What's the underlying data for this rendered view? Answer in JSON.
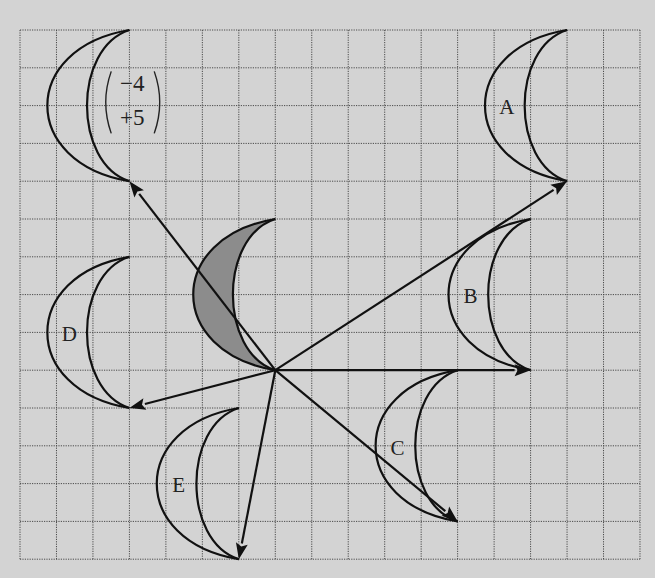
{
  "diagram": {
    "type": "translation-of-crescent-on-grid",
    "background_color": "#d3d3d3",
    "shaded_fill_color": "#8c8c8c",
    "grid": {
      "origin_px": [
        20,
        30
      ],
      "cell_w": 36.47,
      "cell_h": 37.8,
      "cols": 17,
      "rows": 14
    },
    "centre_point": [
      7,
      9
    ],
    "object": {
      "name": "shaded-object",
      "top_tip": [
        7,
        5
      ],
      "bottom_tip": [
        7,
        9
      ],
      "shaded": true
    },
    "images": [
      {
        "name": "image-vector",
        "label": "",
        "top_tip": [
          3,
          0
        ],
        "bottom_tip": [
          3,
          4
        ],
        "vector": [
          -4,
          5
        ],
        "arrow_to": [
          3,
          4
        ]
      },
      {
        "name": "image-A",
        "label": "A",
        "top_tip": [
          15,
          0
        ],
        "bottom_tip": [
          15,
          4
        ],
        "arrow_to": [
          15,
          4
        ],
        "label_pos": [
          13.35,
          2.05
        ]
      },
      {
        "name": "image-B",
        "label": "B",
        "top_tip": [
          14,
          5
        ],
        "bottom_tip": [
          14,
          9
        ],
        "arrow_to": [
          14,
          9
        ],
        "label_pos": [
          12.35,
          7.05
        ]
      },
      {
        "name": "image-C",
        "label": "C",
        "top_tip": [
          12,
          9
        ],
        "bottom_tip": [
          12,
          13
        ],
        "arrow_to": [
          12,
          13
        ],
        "label_pos": [
          10.35,
          11.05
        ]
      },
      {
        "name": "image-D",
        "label": "D",
        "top_tip": [
          3,
          6
        ],
        "bottom_tip": [
          3,
          10
        ],
        "arrow_to": [
          3,
          10
        ],
        "label_pos": [
          1.35,
          8.05
        ]
      },
      {
        "name": "image-E",
        "label": "E",
        "top_tip": [
          6,
          10
        ],
        "bottom_tip": [
          6,
          14
        ],
        "arrow_to": [
          6,
          14
        ],
        "label_pos": [
          4.35,
          12.05
        ]
      }
    ],
    "vector_label": {
      "top": "−4",
      "bottom": "+5",
      "position": [
        2.2,
        1.2
      ]
    }
  }
}
